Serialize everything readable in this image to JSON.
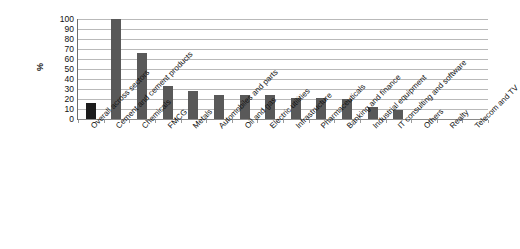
{
  "chart_data": {
    "type": "bar",
    "title": "",
    "subtitle": "",
    "xlabel": "",
    "ylabel": "%",
    "ylim": [
      0,
      100
    ],
    "y_ticks": [
      100,
      90,
      80,
      70,
      60,
      50,
      40,
      30,
      20,
      10,
      0
    ],
    "grid": true,
    "legend": "none",
    "categories": [
      "Overall across sectors",
      "Cement and cement products",
      "Chemicals",
      "FMCG",
      "Metals",
      "Automobiles and parts",
      "Oil and gas",
      "Electric utilities",
      "Infrastructure",
      "Pharmaceuticals",
      "Banking and finance",
      "Industrial equipment",
      "IT consulting and software",
      "Others",
      "Realty",
      "Telecom and TV"
    ],
    "values": [
      16,
      100,
      66,
      33,
      28,
      24,
      24,
      24,
      21,
      21,
      20,
      12,
      9,
      0,
      0,
      0
    ],
    "highlight_index": 0,
    "colors": {
      "bar": "#595959",
      "bar_highlight": "#1c1c1c",
      "gridline": "#b9b9b9",
      "axis": "#6d6d6d",
      "text": "#111111",
      "background": "#ffffff"
    }
  }
}
